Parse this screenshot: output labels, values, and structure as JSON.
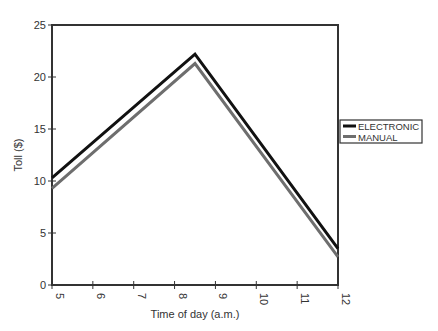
{
  "chart_data": {
    "type": "line",
    "title": "",
    "xlabel": "Time of day (a.m.)",
    "ylabel": "Toll ($)",
    "x": [
      5,
      8.5,
      12
    ],
    "xlim": [
      5,
      12
    ],
    "ylim": [
      0,
      25
    ],
    "xticks": [
      5,
      6,
      7,
      8,
      9,
      10,
      11,
      12
    ],
    "xtick_labels": [
      "5",
      "6",
      "7",
      "8",
      "9",
      "10",
      "11",
      "12"
    ],
    "xtick_rotation": 90,
    "yticks": [
      0,
      5,
      10,
      15,
      20,
      25
    ],
    "ytick_labels": [
      "0",
      "5",
      "10",
      "15",
      "20",
      "25"
    ],
    "grid": false,
    "legend_position": "right, outside plot area",
    "series": [
      {
        "name": "ELECTRONIC",
        "values": [
          10.3,
          22.2,
          3.5
        ],
        "color": "#111111",
        "stroke_width": 3
      },
      {
        "name": "MANUAL",
        "values": [
          9.3,
          21.3,
          2.7
        ],
        "color": "#6e6e6e",
        "stroke_width": 3
      }
    ]
  },
  "legend": {
    "items": [
      {
        "label": "ELECTRONIC",
        "color": "#111111"
      },
      {
        "label": "MANUAL",
        "color": "#6e6e6e"
      }
    ]
  },
  "colors": {
    "axis": "#333333",
    "background": "#ffffff"
  }
}
